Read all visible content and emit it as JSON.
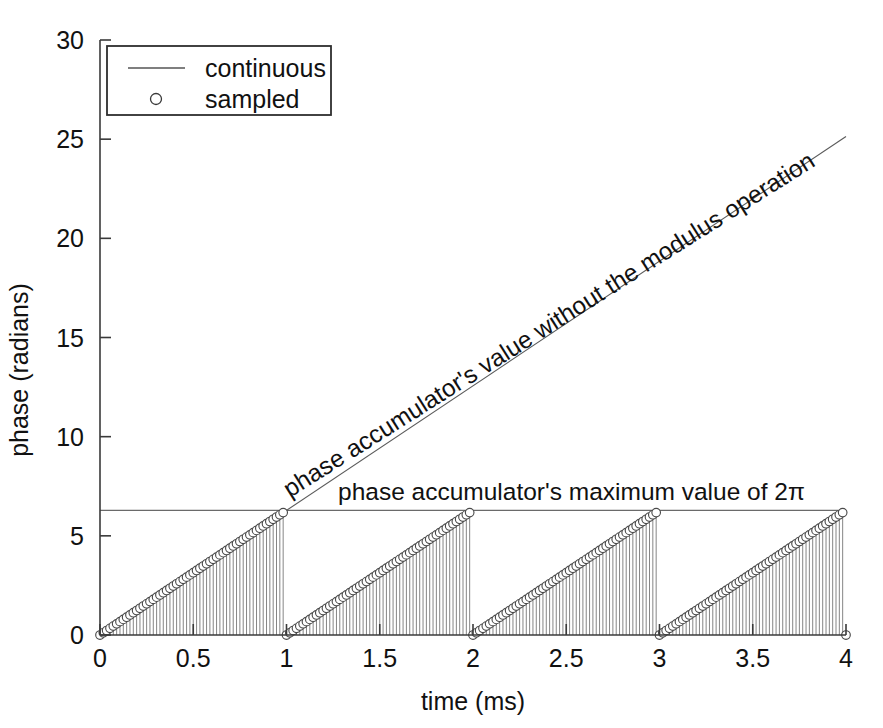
{
  "chart_data": {
    "type": "line",
    "title": "",
    "xlabel": "time (ms)",
    "ylabel": "phase (radians)",
    "xlim": [
      0,
      4
    ],
    "ylim": [
      0,
      30
    ],
    "xticks": [
      0,
      0.5,
      1,
      1.5,
      2,
      2.5,
      3,
      3.5,
      4
    ],
    "xticklabels": [
      "0",
      "0.5",
      "1",
      "1.5",
      "2",
      "2.5",
      "3",
      "3.5",
      "4"
    ],
    "yticks": [
      0,
      5,
      10,
      15,
      20,
      25,
      30
    ],
    "yticklabels": [
      "0",
      "5",
      "10",
      "15",
      "20",
      "25",
      "30"
    ],
    "grid": false,
    "legend": {
      "position": "upper-left",
      "entries": [
        {
          "label": "continuous",
          "marker": "line"
        },
        {
          "label": "sampled",
          "marker": "circle"
        }
      ]
    },
    "series": [
      {
        "name": "unwrapped phase ramp",
        "style": "line",
        "description": "continuous straight ramp from (0,0) to (4, 25.133)",
        "x": [
          0,
          4
        ],
        "values": [
          0,
          25.1327
        ]
      },
      {
        "name": "wrapped phase (modulo 2pi) sampled",
        "style": "stem-with-circles",
        "description": "sawtooth wrapped to 2pi, 56 samples per 1 ms period, 4 periods",
        "samples_per_period": 56,
        "periods": 4,
        "period_ms": 1,
        "min_value": 0,
        "max_value": 6.2832
      }
    ],
    "annotations": [
      {
        "name": "unwrapped-ramp-annotation",
        "text": "phase accumulator's value without the modulus operation",
        "rotated": true,
        "angle_deg": -32.3
      },
      {
        "name": "max-value-annotation",
        "text": "phase accumulator's maximum value of 2π",
        "rotated": false,
        "angle_deg": 0
      }
    ],
    "reference_lines": [
      {
        "name": "two-pi-limit",
        "orientation": "horizontal",
        "value": 6.2832,
        "label": "2π"
      }
    ]
  }
}
